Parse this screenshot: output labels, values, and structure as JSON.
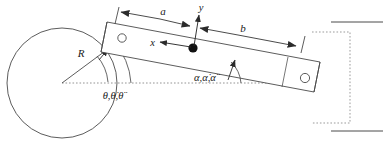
{
  "figure": {
    "type": "mechanism-diagram",
    "stroke_color": "#3a3a3a",
    "fill_color": "#ffffff",
    "text_color": "#1a1a1a"
  },
  "labels": {
    "radius": "R",
    "crank_angle": "θ,θ̇,θ̈",
    "rod_angle": "α,α̇,α̈",
    "dim_a": "a",
    "dim_b": "b",
    "axis_x": "x",
    "axis_y": "y"
  },
  "elements": {
    "disk": {
      "name": "crank-disk",
      "cx": 62,
      "cy": 83,
      "r": 55
    },
    "crank_pin": {
      "name": "crank-pin-hole",
      "cx": 122,
      "cy": 38,
      "r": 4.2
    },
    "slider_pin": {
      "name": "slider-pin-hole",
      "cx": 305,
      "cy": 78,
      "r": 4.6
    },
    "mass_center": {
      "name": "center-of-mass-dot",
      "cx": 193,
      "cy": 48,
      "r": 4.6
    },
    "rod": {
      "name": "connecting-rod",
      "corners": [
        [
          107,
          22
        ],
        [
          320,
          62
        ],
        [
          314,
          92
        ],
        [
          101,
          52
        ]
      ]
    },
    "channel": {
      "name": "slider-channel",
      "top_line_y": 22,
      "bottom_line_y": 131,
      "x_start": 330,
      "x_end": 383
    },
    "baseline": {
      "name": "horizontal-reference-line",
      "y": 83,
      "x_start": 62,
      "x_end": 290
    }
  }
}
